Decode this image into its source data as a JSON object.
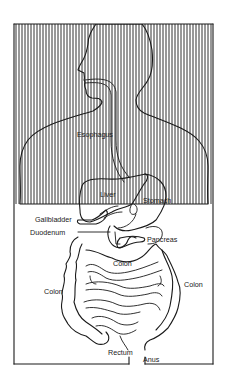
{
  "diagram": {
    "frame_color": "#1a1a1a",
    "background": "#ffffff",
    "labels": [
      {
        "id": "esophagus",
        "text": "Esophagus",
        "x": 77,
        "y": 137
      },
      {
        "id": "liver",
        "text": "Liver",
        "x": 100,
        "y": 197
      },
      {
        "id": "stomach",
        "text": "Stomach",
        "x": 143,
        "y": 203
      },
      {
        "id": "gallbladder",
        "text": "Gallbladder",
        "x": 35,
        "y": 222
      },
      {
        "id": "duodenum",
        "text": "Duodenum",
        "x": 30,
        "y": 235
      },
      {
        "id": "pancreas",
        "text": "Pancreas",
        "x": 147,
        "y": 242
      },
      {
        "id": "colon-transverse",
        "text": "Colon",
        "x": 113,
        "y": 266
      },
      {
        "id": "colon-left",
        "text": "Colon",
        "x": 44,
        "y": 294
      },
      {
        "id": "colon-right",
        "text": "Colon",
        "x": 184,
        "y": 287
      },
      {
        "id": "rectum",
        "text": "Rectum",
        "x": 108,
        "y": 355
      },
      {
        "id": "anus",
        "text": "Anus",
        "x": 143,
        "y": 362
      }
    ]
  }
}
